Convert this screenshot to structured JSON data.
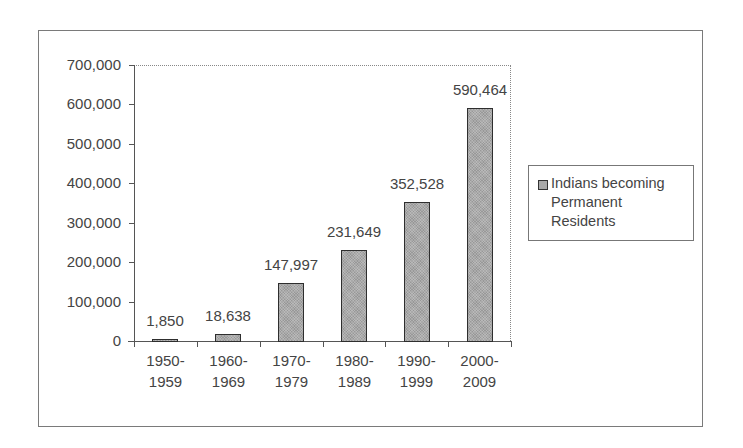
{
  "chart_data": {
    "type": "bar",
    "title": "",
    "xlabel": "",
    "ylabel": "",
    "categories": [
      "1950-1959",
      "1960-1969",
      "1970-1979",
      "1980-1989",
      "1990-1999",
      "2000-2009"
    ],
    "category_lines": [
      [
        "1950-",
        "1959"
      ],
      [
        "1960-",
        "1969"
      ],
      [
        "1970-",
        "1979"
      ],
      [
        "1980-",
        "1989"
      ],
      [
        "1990-",
        "1999"
      ],
      [
        "2000-",
        "2009"
      ]
    ],
    "series": [
      {
        "name": "Indians becoming Permanent Residents",
        "values": [
          1850,
          18638,
          147997,
          231649,
          352528,
          590464
        ],
        "labels": [
          "1,850",
          "18,638",
          "147,997",
          "231,649",
          "352,528",
          "590,464"
        ],
        "color": "#a9a9a9"
      }
    ],
    "ylim": [
      0,
      700000
    ],
    "yticks": [
      0,
      100000,
      200000,
      300000,
      400000,
      500000,
      600000,
      700000
    ],
    "ytick_labels": [
      "0",
      "100,000",
      "200,000",
      "300,000",
      "400,000",
      "500,000",
      "600,000",
      "700,000"
    ],
    "grid": false,
    "legend_position": "right",
    "legend": {
      "lines": [
        "Indians becoming",
        "Permanent",
        "Residents"
      ]
    }
  }
}
